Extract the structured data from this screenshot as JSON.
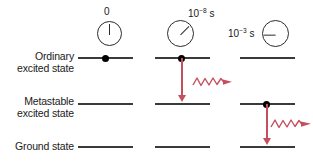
{
  "figure": {
    "background_color": "#ffffff",
    "level_line_color": "#3a3a3a",
    "electron_color": "#000000",
    "transition_color": "#c4505f",
    "width": 313,
    "height": 162
  },
  "levels": [
    {
      "id": "ordinary",
      "line1": "Ordinary",
      "line2": "excited state"
    },
    {
      "id": "metastable",
      "line1": "Metastable",
      "line2": "excited state"
    },
    {
      "id": "ground",
      "line1": "Ground state",
      "line2": ""
    }
  ],
  "columns": [
    {
      "id": "t0",
      "clock": {
        "time_mantissa": "0",
        "time_exponent": "",
        "time_unit": "",
        "label": "0",
        "hand_angle_deg": 0,
        "label_position": "above"
      },
      "electron_level": "ordinary",
      "transition": null,
      "photon": false
    },
    {
      "id": "t1e-8",
      "clock": {
        "time_mantissa": "10",
        "time_exponent": "−8",
        "time_unit": "s",
        "label": "10−8 s",
        "hand_angle_deg": 45,
        "label_position": "upper-right"
      },
      "electron_level": "ordinary",
      "transition": {
        "from": "ordinary",
        "to": "metastable"
      },
      "photon": true
    },
    {
      "id": "t1e-3",
      "clock": {
        "time_mantissa": "10",
        "time_exponent": "−3",
        "time_unit": "s",
        "label": "10−3 s",
        "hand_angle_deg": 270,
        "label_position": "left"
      },
      "electron_level": "metastable",
      "transition": {
        "from": "metastable",
        "to": "ground"
      },
      "photon": true
    }
  ]
}
